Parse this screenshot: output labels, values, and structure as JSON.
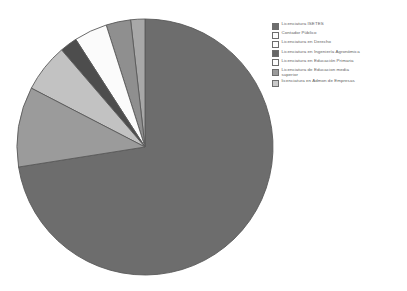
{
  "chart_data": {
    "type": "pie",
    "title": "",
    "subtitle": "",
    "xlabel": "",
    "ylabel": "",
    "grid": false,
    "legend_position": "right",
    "start_angle_deg": 0,
    "direction": "clockwise",
    "categories": [
      "Licenciatura ISETES",
      "Contador Público",
      "Licenciatura en Derecho",
      "Licenciatura en Ingeniería Agronómica",
      "Licenciatura en Educación Primaria",
      "Licenciatura de Educacion media superior",
      "Licenciatura en Admon de Empresas"
    ],
    "values": [
      72.5,
      1.8,
      3.1,
      4.2,
      2.2,
      6.1,
      10.1
    ],
    "units": "percent",
    "colors": [
      "#6d6d6d",
      "#a8a8a8",
      "#8f8f8f",
      "#fbfbfb",
      "#4d4d4d",
      "#c2c2c2",
      "#9b9b9b"
    ],
    "slices": [
      {
        "label": "Licenciatura ISETES",
        "value": 72.5,
        "color": "#6d6d6d"
      },
      {
        "label": "Contador Público",
        "value": 1.8,
        "color": "#a8a8a8"
      },
      {
        "label": "Licenciatura en Derecho",
        "value": 3.1,
        "color": "#8f8f8f"
      },
      {
        "label": "Licenciatura en Ingeniería Agronómica",
        "value": 4.2,
        "color": "#fbfbfb"
      },
      {
        "label": "Licenciatura en Educación Primaria",
        "value": 2.2,
        "color": "#4d4d4d"
      },
      {
        "label": "Licenciatura de Educacion media superior",
        "value": 6.1,
        "color": "#c2c2c2"
      },
      {
        "label": "Licenciatura en Admon de Empresas",
        "value": 10.1,
        "color": "#9b9b9b"
      }
    ],
    "annotations": []
  },
  "legend": {
    "items": [
      {
        "label": "Licenciatura ISETES",
        "color": "#6d6d6d"
      },
      {
        "label": "Contador Público",
        "color": "#fdfdfd"
      },
      {
        "label": "Licenciatura en Derecho",
        "color": "#fdfdfd"
      },
      {
        "label": "Licenciatura en Ingeniería  Agronómica",
        "color": "#666666"
      },
      {
        "label": "Licenciatura en Educación Primaria",
        "color": "#fdfdfd"
      },
      {
        "label": "Licenciatura de Educacion media\nsuperior",
        "color": "#9b9b9b"
      },
      {
        "label": "licenciatura en Admon de Empresas",
        "color": "#c9c9c9"
      }
    ]
  },
  "figure": {
    "background": "#ffffff",
    "pie_center_x": 145,
    "pie_center_y": 147,
    "pie_radius": 128,
    "outline_color": "#5a5a5a"
  }
}
